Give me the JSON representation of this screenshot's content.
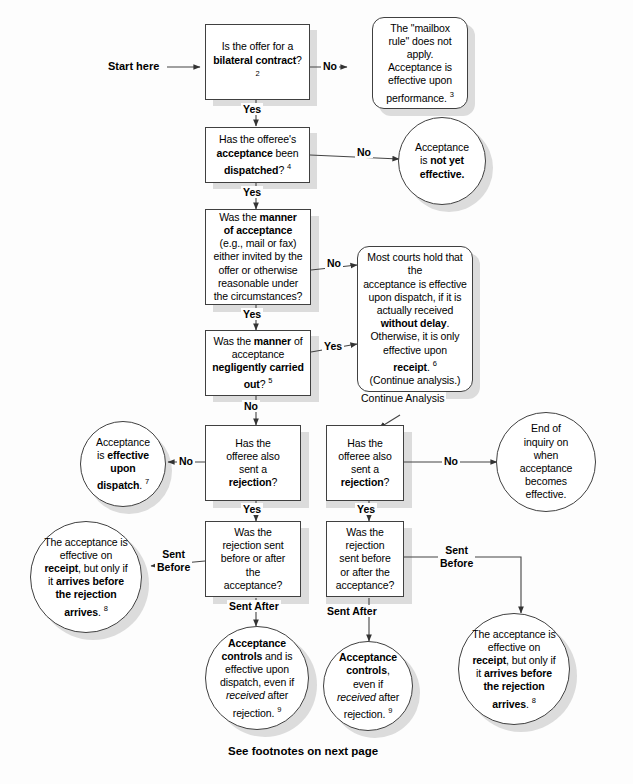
{
  "footer": "See footnotes on next page",
  "start_label": "Start here",
  "continue_label": "Continue Analysis",
  "labels": {
    "yes": "Yes",
    "no": "No",
    "sent_before": "Sent\nBefore",
    "sent_before_wide": "Sent\nBefore",
    "sent_after": "Sent After"
  },
  "nodes": {
    "q1": {
      "shape": "rect",
      "text_plain": "Is the offer for a bilateral contract? 2",
      "footnote": "2"
    },
    "out_mailbox": {
      "shape": "round",
      "text_plain": "The \"mailbox rule\" does not apply. Acceptance is effective upon performance. 3",
      "footnote": "3"
    },
    "q2": {
      "shape": "rect",
      "text_plain": "Has the offeree's acceptance been dispatched? 4",
      "footnote": "4"
    },
    "out_notyet": {
      "shape": "ellipse",
      "text_plain": "Acceptance is not yet effective."
    },
    "q3": {
      "shape": "rect",
      "text_plain": "Was the manner of acceptance (e.g., mail or fax) either invited by the offer or otherwise reasonable under the circumstances?"
    },
    "out_mostcourts": {
      "shape": "round",
      "text_plain": "Most courts hold that the acceptance is effective upon dispatch, if it is actually received without delay. Otherwise, it is only effective upon receipt. 6 (Continue analysis.)",
      "footnote": "6"
    },
    "q4": {
      "shape": "rect",
      "text_plain": "Was the manner of acceptance negligently carried out? 5",
      "footnote": "5"
    },
    "out_dispatch": {
      "shape": "ellipse",
      "text_plain": "Acceptance is effective upon dispatch. 7",
      "footnote": "7"
    },
    "q5_left": {
      "shape": "rect",
      "text_plain": "Has the offeree also sent a rejection?"
    },
    "q5_right": {
      "shape": "rect",
      "text_plain": "Has the offeree also sent a rejection?"
    },
    "out_endinquiry": {
      "shape": "ellipse",
      "text_plain": "End of inquiry on when acceptance becomes effective."
    },
    "out_receipt_left": {
      "shape": "ellipse",
      "text_plain": "The acceptance is effective on receipt, but only if it arrives before the rejection arrives. 8",
      "footnote": "8"
    },
    "q6_left": {
      "shape": "rect",
      "text_plain": "Was the rejection sent before or after the acceptance?"
    },
    "q6_right": {
      "shape": "rect",
      "text_plain": "Was the rejection sent before or after the acceptance?"
    },
    "out_receipt_right": {
      "shape": "ellipse",
      "text_plain": "The acceptance is effective on receipt, but only if it arrives before the rejection arrives. 8",
      "footnote": "8"
    },
    "out_controls_left": {
      "shape": "ellipse",
      "text_plain": "Acceptance controls and is effective upon dispatch, even if received after rejection. 9",
      "footnote": "9"
    },
    "out_controls_right": {
      "shape": "ellipse",
      "text_plain": "Acceptance controls, even if received after rejection. 9",
      "footnote": "9"
    }
  },
  "colors": {
    "background": "#fdfdfd",
    "node_border": "#404040",
    "node_fill": "#ffffff",
    "shadow": "#dcdcdc",
    "text": "#000000",
    "wire": "#444444"
  }
}
